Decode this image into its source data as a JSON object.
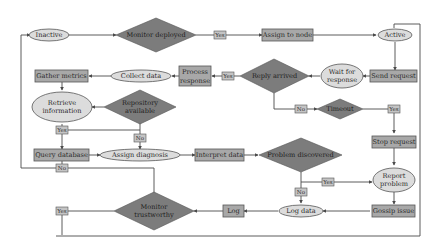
{
  "colors": {
    "process_fill": "#a8a8a8",
    "state_fill": "#dcdcdc",
    "decision_fill": "#7c7c7c",
    "edge_label_fill": "#c4c4c4",
    "line": "#4a4a4a"
  },
  "nodes": {
    "inactive": {
      "type": "state",
      "label": "Inactive"
    },
    "monitor_deployed": {
      "type": "decision",
      "label": "Monitor deployed"
    },
    "assign_to_node": {
      "type": "process",
      "label": "Assign to node"
    },
    "active": {
      "type": "state",
      "label": "Active"
    },
    "send_request": {
      "type": "process",
      "label": "Send request"
    },
    "wait_for_response": {
      "type": "state",
      "label_line1": "Wait for",
      "label_line2": "response"
    },
    "reply_arrived": {
      "type": "decision",
      "label": "Reply arrived"
    },
    "process_response": {
      "type": "process",
      "label_line1": "Process",
      "label_line2": "response"
    },
    "collect_data": {
      "type": "state",
      "label": "Collect data"
    },
    "gather_metrics": {
      "type": "process",
      "label": "Gather metrics"
    },
    "retrieve_information": {
      "type": "state",
      "label_line1": "Retrieve",
      "label_line2": "information"
    },
    "repository_available": {
      "type": "decision",
      "label_line1": "Repository",
      "label_line2": "available"
    },
    "query_database": {
      "type": "process",
      "label": "Query database"
    },
    "assign_diagnosis": {
      "type": "state",
      "label": "Assign diagnosis"
    },
    "interpret_data": {
      "type": "process",
      "label": "Interpret data"
    },
    "problem_discovered": {
      "type": "decision",
      "label": "Problem discovered"
    },
    "timeout": {
      "type": "decision",
      "label": "Timeout"
    },
    "stop_request": {
      "type": "process",
      "label": "Stop request"
    },
    "report_problem": {
      "type": "state",
      "label_line1": "Report",
      "label_line2": "problem"
    },
    "gossip_issue": {
      "type": "process",
      "label": "Gossip issue"
    },
    "log_data": {
      "type": "state",
      "label": "Log data"
    },
    "log": {
      "type": "process",
      "label": "Log"
    },
    "monitor_trustworthy": {
      "type": "decision",
      "label_line1": "Monitor",
      "label_line2": "trustworthy"
    }
  },
  "edge_labels": {
    "monitor_deployed_yes": "Yes",
    "reply_arrived_yes": "Yes",
    "reply_arrived_no": "No",
    "timeout_yes": "Yes",
    "repository_yes": "Yes",
    "repository_no": "No",
    "query_no": "No",
    "problem_yes": "Yes",
    "problem_no": "No",
    "trustworthy_yes": "Yes"
  }
}
